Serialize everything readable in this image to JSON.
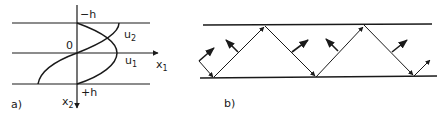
{
  "panel_a": {
    "label": "a)",
    "axis_labels": {
      "x1": "x",
      "x1_sub": "1",
      "x2": "x",
      "x2_sub": "2"
    },
    "boundary_labels": {
      "top": "−h",
      "bottom": "+h",
      "origin": "0"
    },
    "curves": [
      {
        "name": "u",
        "sub": "1",
        "description": "symmetric mode profile"
      },
      {
        "name": "u",
        "sub": "2",
        "description": "antisymmetric mode profile"
      }
    ]
  },
  "panel_b": {
    "label": "b)",
    "description": "ray zigzag reflecting between two parallel boundaries with normal vectors",
    "reflections": 4
  },
  "colors": {
    "ink": "#1a1a1a",
    "background": "#ffffff"
  }
}
